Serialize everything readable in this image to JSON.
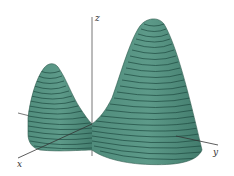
{
  "figure": {
    "title": "",
    "axes": {
      "x_label": "x",
      "y_label": "y",
      "z_label": "z"
    },
    "colors": {
      "surface": "#5a9686",
      "surface_dark": "#3f7869",
      "contour": "#1e4a40",
      "axis": "#555555",
      "background": "#ffffff"
    },
    "peaks": [
      {
        "name": "small-peak",
        "position": "left"
      },
      {
        "name": "large-peak",
        "position": "right"
      }
    ]
  }
}
